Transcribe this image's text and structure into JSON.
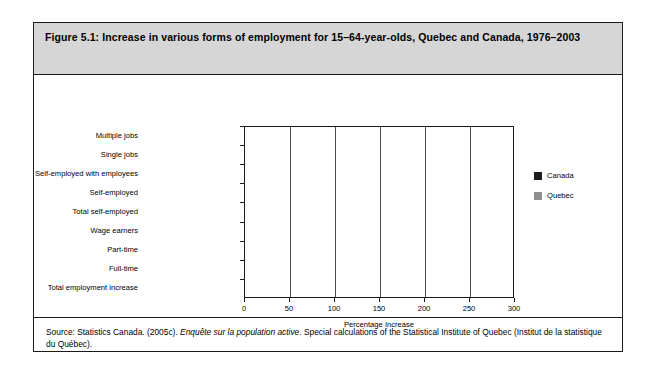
{
  "figure": {
    "title": "Figure 5.1: Increase in various forms of employment for 15–64-year-olds, Quebec and Canada, 1976–2003",
    "source_prefix": "Source: Statistics Canada. (2005c). ",
    "source_italic": "Enquête sur la population active",
    "source_suffix": ". Special calculations of the Statistical Institute of Quebec (Institut de la statistique du Québec)."
  },
  "chart_data": {
    "type": "bar",
    "orientation": "horizontal",
    "title": "Increase in various forms of employment for 15–64-year-olds, Quebec and Canada, 1976–2003",
    "xlabel": "Percentage Increase",
    "ylabel": "",
    "xlim": [
      0,
      300
    ],
    "xticks": [
      0,
      50,
      100,
      150,
      200,
      250,
      300
    ],
    "grid": true,
    "legend_position": "right",
    "categories": [
      "Multiple jobs",
      "Single jobs",
      "Self-employed with employees",
      "Self-employed",
      "Total self-employed",
      "Wage earners",
      "Part-time",
      "Full-time",
      "Total employment increase"
    ],
    "series": [
      {
        "name": "Canada",
        "color": "#1c1c1c",
        "values": [
          272,
          58,
          80,
          158,
          122,
          61,
          143,
          50,
          61
        ]
      },
      {
        "name": "Quebec",
        "color": "#8f8f8f",
        "values": [
          254,
          52,
          74,
          150,
          108,
          47,
          199,
          33,
          50
        ]
      }
    ]
  },
  "legend": {
    "items": [
      {
        "label": "Canada",
        "color": "#1c1c1c"
      },
      {
        "label": "Quebec",
        "color": "#8f8f8f"
      }
    ]
  }
}
